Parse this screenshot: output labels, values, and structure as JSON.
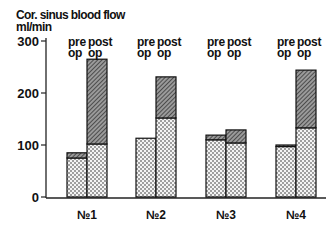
{
  "chart_data": {
    "type": "bar",
    "stacked": true,
    "title": "Cor. sinus blood flow",
    "ylabel": "ml/min",
    "xlabel": "",
    "ylim": [
      0,
      300
    ],
    "yticks": [
      0,
      100,
      200,
      300
    ],
    "grid": false,
    "categories": [
      "№1",
      "№2",
      "№3",
      "№4"
    ],
    "bar_labels": {
      "pre": [
        "pre",
        "op"
      ],
      "post": [
        "post",
        "op"
      ]
    },
    "series": [
      {
        "name": "pre op (dotted base)",
        "pattern": "dotted",
        "values": [
          75,
          113,
          110,
          97
        ]
      },
      {
        "name": "pre op (hatched increment)",
        "pattern": "hatched",
        "values": [
          10,
          0,
          9,
          3
        ]
      },
      {
        "name": "post op (dotted base)",
        "pattern": "dotted",
        "values": [
          102,
          152,
          104,
          133
        ]
      },
      {
        "name": "post op (hatched increment)",
        "pattern": "hatched",
        "values": [
          163,
          79,
          25,
          111
        ]
      }
    ],
    "totals": {
      "pre_op": [
        85,
        113,
        119,
        100
      ],
      "post_op": [
        265,
        231,
        129,
        244
      ]
    }
  },
  "text": {
    "title": "Cor. sinus blood flow",
    "unit": "ml/min",
    "yticks": [
      "300",
      "200",
      "100",
      "0"
    ],
    "pre_line1": "pre",
    "pre_line2": "op",
    "post_line1": "post",
    "post_line2": "op",
    "groups": [
      "№1",
      "№2",
      "№3",
      "№4"
    ]
  }
}
